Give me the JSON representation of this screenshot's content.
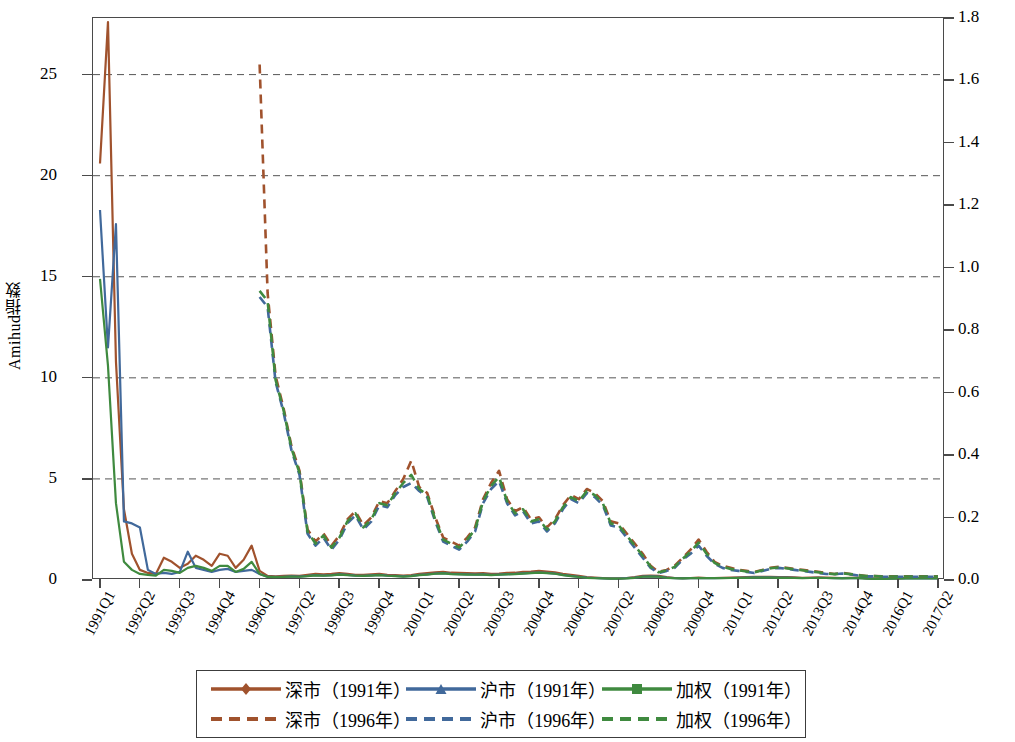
{
  "axes": {
    "y_left_label": "Amihud指数",
    "y_left_ticks": [
      "0",
      "5",
      "10",
      "15",
      "20",
      "25"
    ],
    "y_right_ticks": [
      "0.0",
      "0.2",
      "0.4",
      "0.6",
      "0.8",
      "1.0",
      "1.2",
      "1.4",
      "1.6",
      "1.8"
    ],
    "x_ticks": [
      "1991Q1",
      "1992Q2",
      "1993Q3",
      "1994Q4",
      "1996Q1",
      "1997Q2",
      "1998Q3",
      "1999Q4",
      "2001Q1",
      "2002Q2",
      "2003Q3",
      "2004Q4",
      "2006Q1",
      "2007Q2",
      "2008Q3",
      "2009Q4",
      "2011Q1",
      "2012Q2",
      "2013Q3",
      "2014Q4",
      "2016Q1",
      "2017Q2"
    ]
  },
  "legend": {
    "items": [
      {
        "label": "深市（1991年）",
        "color": "#a0522d",
        "style": "solid",
        "marker": "diamond"
      },
      {
        "label": "沪市（1991年）",
        "color": "#41699b",
        "style": "solid",
        "marker": "triangle"
      },
      {
        "label": "加权（1991年）",
        "color": "#3f8a3f",
        "style": "solid",
        "marker": "square"
      },
      {
        "label": "深市（1996年）",
        "color": "#a0522d",
        "style": "dashed",
        "marker": "none"
      },
      {
        "label": "沪市（1996年）",
        "color": "#41699b",
        "style": "dashed",
        "marker": "none"
      },
      {
        "label": "加权（1996年）",
        "color": "#3f8a3f",
        "style": "dashed",
        "marker": "none"
      }
    ]
  },
  "colors": {
    "shenzhen": "#a0522d",
    "shanghai": "#41699b",
    "weighted": "#3f8a3f",
    "axis": "#4a4a4a",
    "grid": "#555555"
  },
  "chart_data": {
    "type": "line",
    "title": "",
    "xlabel": "",
    "ylabel": "Amihud指数",
    "ylabel_right": "",
    "ylim": [
      0,
      27.8
    ],
    "ylim_right": [
      0.0,
      1.8
    ],
    "grid": true,
    "legend_position": "bottom",
    "x": [
      "1991Q1",
      "1991Q2",
      "1991Q3",
      "1991Q4",
      "1992Q1",
      "1992Q2",
      "1992Q3",
      "1992Q4",
      "1993Q1",
      "1993Q2",
      "1993Q3",
      "1993Q4",
      "1994Q1",
      "1994Q2",
      "1994Q3",
      "1994Q4",
      "1995Q1",
      "1995Q2",
      "1995Q3",
      "1995Q4",
      "1996Q1",
      "1996Q2",
      "1996Q3",
      "1996Q4",
      "1997Q1",
      "1997Q2",
      "1997Q3",
      "1997Q4",
      "1998Q1",
      "1998Q2",
      "1998Q3",
      "1998Q4",
      "1999Q1",
      "1999Q2",
      "1999Q3",
      "1999Q4",
      "2000Q1",
      "2000Q2",
      "2000Q3",
      "2000Q4",
      "2001Q1",
      "2001Q2",
      "2001Q3",
      "2001Q4",
      "2002Q1",
      "2002Q2",
      "2002Q3",
      "2002Q4",
      "2003Q1",
      "2003Q2",
      "2003Q3",
      "2003Q4",
      "2004Q1",
      "2004Q2",
      "2004Q3",
      "2004Q4",
      "2005Q1",
      "2005Q2",
      "2005Q3",
      "2005Q4",
      "2006Q1",
      "2006Q2",
      "2006Q3",
      "2006Q4",
      "2007Q1",
      "2007Q2",
      "2007Q3",
      "2007Q4",
      "2008Q1",
      "2008Q2",
      "2008Q3",
      "2008Q4",
      "2009Q1",
      "2009Q2",
      "2009Q3",
      "2009Q4",
      "2010Q1",
      "2010Q2",
      "2010Q3",
      "2010Q4",
      "2011Q1",
      "2011Q2",
      "2011Q3",
      "2011Q4",
      "2012Q1",
      "2012Q2",
      "2012Q3",
      "2012Q4",
      "2013Q1",
      "2013Q2",
      "2013Q3",
      "2013Q4",
      "2014Q1",
      "2014Q2",
      "2014Q3",
      "2014Q4",
      "2015Q1",
      "2015Q2",
      "2015Q3",
      "2015Q4",
      "2016Q1",
      "2016Q2",
      "2016Q3",
      "2016Q4",
      "2017Q1",
      "2017Q2"
    ],
    "series": [
      {
        "name": "深市（1991年）",
        "color": "#a0522d",
        "style": "solid",
        "axis": "left",
        "values": [
          20.6,
          27.6,
          10.8,
          3.5,
          1.3,
          0.5,
          0.35,
          0.3,
          1.1,
          0.9,
          0.6,
          0.8,
          1.2,
          1.0,
          0.7,
          1.3,
          1.2,
          0.6,
          1.0,
          1.7,
          0.45,
          0.2,
          0.18,
          0.2,
          0.22,
          0.2,
          0.25,
          0.3,
          0.28,
          0.3,
          0.34,
          0.3,
          0.26,
          0.25,
          0.28,
          0.3,
          0.26,
          0.24,
          0.22,
          0.24,
          0.3,
          0.34,
          0.38,
          0.4,
          0.36,
          0.35,
          0.34,
          0.33,
          0.34,
          0.3,
          0.32,
          0.35,
          0.36,
          0.4,
          0.42,
          0.45,
          0.42,
          0.38,
          0.3,
          0.25,
          0.2,
          0.14,
          0.12,
          0.1,
          0.08,
          0.08,
          0.1,
          0.14,
          0.2,
          0.22,
          0.2,
          0.14,
          0.1,
          0.09,
          0.1,
          0.12,
          0.1,
          0.1,
          0.11,
          0.12,
          0.13,
          0.14,
          0.15,
          0.16,
          0.15,
          0.14,
          0.14,
          0.13,
          0.11,
          0.12,
          0.13,
          0.12,
          0.11,
          0.1,
          0.11,
          0.12,
          0.09,
          0.07,
          0.07,
          0.08,
          0.09,
          0.1,
          0.1,
          0.1,
          0.1,
          0.1
        ]
      },
      {
        "name": "沪市（1991年）",
        "color": "#41699b",
        "style": "solid",
        "axis": "left",
        "values": [
          18.3,
          11.5,
          17.6,
          2.9,
          2.8,
          2.6,
          0.5,
          0.3,
          0.35,
          0.3,
          0.4,
          1.4,
          0.6,
          0.5,
          0.4,
          0.5,
          0.55,
          0.4,
          0.45,
          0.5,
          0.3,
          0.16,
          0.15,
          0.16,
          0.18,
          0.17,
          0.2,
          0.24,
          0.22,
          0.24,
          0.28,
          0.25,
          0.22,
          0.21,
          0.23,
          0.25,
          0.22,
          0.2,
          0.18,
          0.2,
          0.25,
          0.28,
          0.32,
          0.34,
          0.3,
          0.29,
          0.28,
          0.27,
          0.28,
          0.25,
          0.27,
          0.29,
          0.3,
          0.33,
          0.35,
          0.37,
          0.35,
          0.32,
          0.25,
          0.2,
          0.16,
          0.12,
          0.1,
          0.08,
          0.07,
          0.07,
          0.09,
          0.12,
          0.17,
          0.18,
          0.17,
          0.12,
          0.09,
          0.08,
          0.09,
          0.1,
          0.09,
          0.09,
          0.1,
          0.1,
          0.11,
          0.12,
          0.13,
          0.13,
          0.13,
          0.12,
          0.12,
          0.11,
          0.1,
          0.1,
          0.11,
          0.1,
          0.09,
          0.09,
          0.09,
          0.1,
          0.08,
          0.06,
          0.06,
          0.07,
          0.08,
          0.08,
          0.08,
          0.08,
          0.08,
          0.08
        ]
      },
      {
        "name": "加权（1991年）",
        "color": "#3f8a3f",
        "style": "solid",
        "axis": "left",
        "values": [
          14.9,
          10.6,
          3.8,
          0.9,
          0.5,
          0.3,
          0.25,
          0.22,
          0.5,
          0.45,
          0.35,
          0.6,
          0.7,
          0.6,
          0.45,
          0.7,
          0.7,
          0.4,
          0.55,
          0.9,
          0.3,
          0.15,
          0.14,
          0.15,
          0.17,
          0.16,
          0.19,
          0.23,
          0.21,
          0.23,
          0.27,
          0.24,
          0.21,
          0.2,
          0.22,
          0.24,
          0.21,
          0.19,
          0.17,
          0.19,
          0.24,
          0.27,
          0.31,
          0.33,
          0.29,
          0.28,
          0.27,
          0.26,
          0.27,
          0.24,
          0.26,
          0.28,
          0.29,
          0.32,
          0.34,
          0.36,
          0.34,
          0.31,
          0.24,
          0.19,
          0.15,
          0.11,
          0.09,
          0.08,
          0.07,
          0.07,
          0.08,
          0.11,
          0.16,
          0.17,
          0.16,
          0.11,
          0.09,
          0.08,
          0.09,
          0.1,
          0.09,
          0.09,
          0.09,
          0.1,
          0.1,
          0.11,
          0.12,
          0.12,
          0.12,
          0.11,
          0.11,
          0.1,
          0.09,
          0.1,
          0.1,
          0.1,
          0.09,
          0.08,
          0.09,
          0.09,
          0.07,
          0.06,
          0.06,
          0.07,
          0.07,
          0.08,
          0.08,
          0.08,
          0.08,
          0.08
        ]
      },
      {
        "name": "深市（1996年）",
        "color": "#a0522d",
        "style": "dashed",
        "axis": "left",
        "values": [
          null,
          null,
          null,
          null,
          null,
          null,
          null,
          null,
          null,
          null,
          null,
          null,
          null,
          null,
          null,
          null,
          null,
          null,
          null,
          null,
          25.5,
          14.2,
          10.1,
          8.5,
          6.6,
          5.4,
          2.5,
          1.9,
          2.3,
          1.7,
          2.2,
          3.0,
          3.4,
          2.7,
          3.1,
          3.9,
          3.8,
          4.4,
          5.0,
          5.9,
          4.6,
          4.3,
          3.1,
          2.1,
          1.9,
          1.7,
          2.1,
          2.6,
          4.0,
          4.8,
          5.4,
          4.0,
          3.4,
          3.6,
          3.0,
          3.1,
          2.6,
          3.0,
          3.7,
          4.2,
          4.0,
          4.5,
          4.3,
          3.9,
          2.9,
          2.8,
          2.3,
          1.8,
          1.3,
          0.7,
          0.4,
          0.5,
          0.7,
          1.1,
          1.5,
          2.0,
          1.4,
          0.9,
          0.7,
          0.6,
          0.5,
          0.45,
          0.4,
          0.5,
          0.6,
          0.65,
          0.6,
          0.55,
          0.5,
          0.45,
          0.4,
          0.35,
          0.3,
          0.35,
          0.3,
          0.25,
          0.2,
          0.2,
          0.18,
          0.18,
          0.18,
          0.18,
          0.18,
          0.18,
          0.18,
          0.18
        ]
      },
      {
        "name": "沪市（1996年）",
        "color": "#41699b",
        "style": "dashed",
        "axis": "left",
        "values": [
          null,
          null,
          null,
          null,
          null,
          null,
          null,
          null,
          null,
          null,
          null,
          null,
          null,
          null,
          null,
          null,
          null,
          null,
          null,
          null,
          14.0,
          13.5,
          9.8,
          8.3,
          6.4,
          5.2,
          2.3,
          1.7,
          2.1,
          1.5,
          2.0,
          2.8,
          3.2,
          2.5,
          2.9,
          3.7,
          3.6,
          4.2,
          4.6,
          4.8,
          4.4,
          4.1,
          2.9,
          1.9,
          1.7,
          1.5,
          1.9,
          2.4,
          3.8,
          4.5,
          4.9,
          3.8,
          3.2,
          3.4,
          2.8,
          2.9,
          2.4,
          2.8,
          3.5,
          4.0,
          3.8,
          4.3,
          4.1,
          3.7,
          2.7,
          2.6,
          2.1,
          1.6,
          1.1,
          0.6,
          0.35,
          0.45,
          0.6,
          1.0,
          1.3,
          1.7,
          1.2,
          0.8,
          0.6,
          0.5,
          0.45,
          0.4,
          0.35,
          0.45,
          0.55,
          0.6,
          0.55,
          0.5,
          0.45,
          0.4,
          0.35,
          0.3,
          0.28,
          0.32,
          0.28,
          0.22,
          0.18,
          0.18,
          0.16,
          0.16,
          0.16,
          0.16,
          0.16,
          0.16,
          0.16,
          0.16
        ]
      },
      {
        "name": "加权（1996年）",
        "color": "#3f8a3f",
        "style": "dashed",
        "axis": "left",
        "values": [
          null,
          null,
          null,
          null,
          null,
          null,
          null,
          null,
          null,
          null,
          null,
          null,
          null,
          null,
          null,
          null,
          null,
          null,
          null,
          null,
          14.3,
          13.8,
          9.9,
          8.4,
          6.5,
          5.3,
          2.4,
          1.8,
          2.2,
          1.6,
          2.1,
          2.9,
          3.3,
          2.6,
          3.0,
          3.8,
          3.7,
          4.3,
          4.8,
          5.2,
          4.5,
          4.2,
          3.0,
          2.0,
          1.8,
          1.6,
          2.0,
          2.5,
          3.9,
          4.65,
          5.1,
          3.9,
          3.3,
          3.5,
          2.9,
          3.0,
          2.5,
          2.9,
          3.6,
          4.1,
          3.9,
          4.4,
          4.2,
          3.8,
          2.8,
          2.7,
          2.2,
          1.7,
          1.2,
          0.65,
          0.38,
          0.48,
          0.65,
          1.05,
          1.4,
          1.85,
          1.3,
          0.85,
          0.65,
          0.55,
          0.48,
          0.42,
          0.38,
          0.48,
          0.58,
          0.62,
          0.58,
          0.52,
          0.48,
          0.42,
          0.38,
          0.32,
          0.29,
          0.33,
          0.29,
          0.23,
          0.19,
          0.19,
          0.17,
          0.17,
          0.17,
          0.17,
          0.17,
          0.17,
          0.17,
          0.17
        ]
      }
    ]
  }
}
